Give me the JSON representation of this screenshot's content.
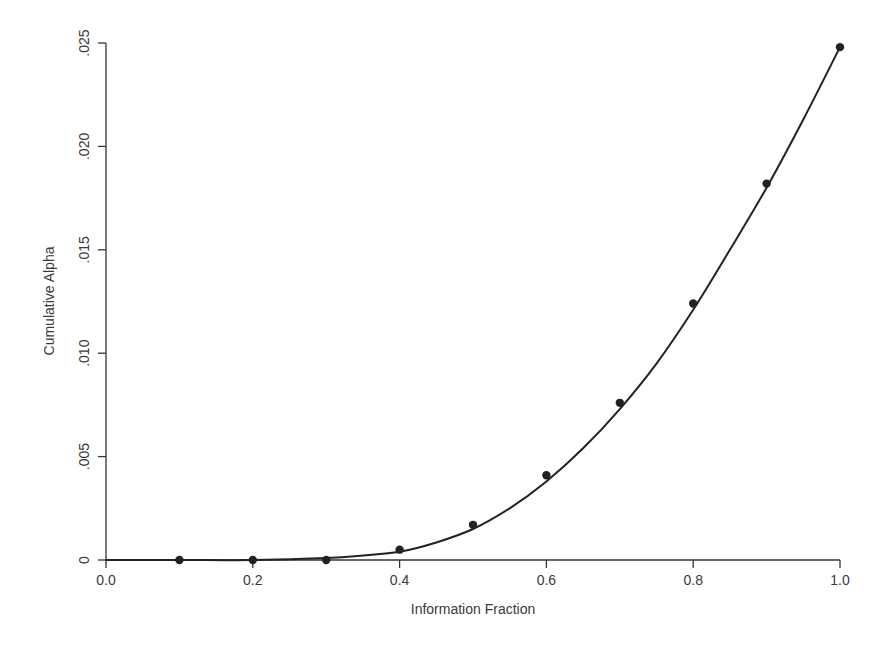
{
  "chart_data": {
    "type": "line",
    "title": "",
    "xlabel": "Information Fraction",
    "ylabel": "Cumulative Alpha",
    "xlim": [
      0.0,
      1.0
    ],
    "ylim": [
      0,
      0.025
    ],
    "x_ticks": [
      0.0,
      0.2,
      0.4,
      0.6,
      0.8,
      1.0
    ],
    "x_tick_labels": [
      "0.0",
      "0.2",
      "0.4",
      "0.6",
      "0.8",
      "1.0"
    ],
    "y_ticks": [
      0,
      0.005,
      0.01,
      0.015,
      0.02,
      0.025
    ],
    "y_tick_labels": [
      "0",
      ".005",
      ".010",
      ".015",
      ".020",
      ".025"
    ],
    "grid": false,
    "legend": null,
    "series": [
      {
        "name": "Observed cumulative alpha",
        "style": "points",
        "x": [
          0.1,
          0.2,
          0.3,
          0.4,
          0.5,
          0.6,
          0.7,
          0.8,
          0.9,
          1.0
        ],
        "values": [
          0.0,
          0.0,
          0.0,
          0.0005,
          0.0017,
          0.0041,
          0.0076,
          0.0124,
          0.0182,
          0.0248
        ]
      },
      {
        "name": "Spending function curve",
        "style": "line",
        "x": [
          0.0,
          0.1,
          0.2,
          0.3,
          0.35,
          0.4,
          0.45,
          0.5,
          0.55,
          0.6,
          0.65,
          0.7,
          0.75,
          0.8,
          0.85,
          0.9,
          0.95,
          1.0
        ],
        "values": [
          0.0,
          0.0,
          0.0,
          0.0001,
          0.00022,
          0.0004,
          0.00085,
          0.0015,
          0.0025,
          0.0038,
          0.0054,
          0.0073,
          0.0095,
          0.0121,
          0.015,
          0.018,
          0.0213,
          0.0248
        ]
      }
    ]
  }
}
